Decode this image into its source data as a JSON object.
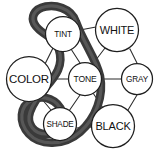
{
  "diagram": {
    "type": "node-link-graph",
    "canvas": {
      "width": 159,
      "height": 156,
      "background": "#ffffff"
    },
    "style": {
      "node_fill": "#ffffff",
      "node_stroke": "#1f1f1f",
      "edge_stroke": "#2b2b2b",
      "ribbon_outer": "#3a3a3a",
      "ribbon_inner": "#6f6f6f",
      "label_color": "#111111"
    },
    "nodes": [
      {
        "id": "tint",
        "label": "TINT",
        "cx": 63,
        "cy": 34,
        "r": 17.5,
        "font_size": 8.2
      },
      {
        "id": "white",
        "label": "WHITE",
        "cx": 117,
        "cy": 30,
        "r": 21.5,
        "font_size": 11.0
      },
      {
        "id": "color",
        "label": "COLOR",
        "cx": 29,
        "cy": 79,
        "r": 22.5,
        "font_size": 11.5
      },
      {
        "id": "tone",
        "label": "TONE",
        "cx": 85,
        "cy": 79,
        "r": 16.5,
        "font_size": 8.6
      },
      {
        "id": "gray",
        "label": "GRAY",
        "cx": 137,
        "cy": 79,
        "r": 15.5,
        "font_size": 8.2
      },
      {
        "id": "shade",
        "label": "SHADE",
        "cx": 60,
        "cy": 124,
        "r": 16.5,
        "font_size": 8.2
      },
      {
        "id": "black",
        "label": "BLACK",
        "cx": 113,
        "cy": 126,
        "r": 21.5,
        "font_size": 11.0
      }
    ],
    "edges": [
      {
        "id": "color-tint",
        "from": "color",
        "to": "tint",
        "label": ""
      },
      {
        "id": "tint-tone",
        "from": "tint",
        "to": "tone",
        "label": ""
      },
      {
        "id": "tint-white",
        "from": "tint",
        "to": "white",
        "label": ""
      },
      {
        "id": "white-tone",
        "from": "white",
        "to": "tone",
        "label": ""
      },
      {
        "id": "white-gray",
        "from": "white",
        "to": "gray",
        "label": ""
      },
      {
        "id": "color-tone",
        "from": "color",
        "to": "tone",
        "label": ""
      },
      {
        "id": "tone-gray",
        "from": "tone",
        "to": "gray",
        "label": ""
      },
      {
        "id": "color-shade",
        "from": "color",
        "to": "shade",
        "label": ""
      },
      {
        "id": "shade-tone",
        "from": "shade",
        "to": "tone",
        "label": ""
      },
      {
        "id": "tone-black",
        "from": "tone",
        "to": "black",
        "label": ""
      },
      {
        "id": "shade-black",
        "from": "shade",
        "to": "black",
        "label": ""
      },
      {
        "id": "black-gray",
        "from": "black",
        "to": "gray",
        "label": ""
      }
    ],
    "ribbon": {
      "id": "s-curve-highlight",
      "description": "thick dark S-shaped closed ribbon looping around TINT and SHADE",
      "path_outer": "M 76 22 C 84 44, 96 58, 100 76 C 104 96, 96 118, 80 132 C 64 146, 40 146, 29 134 C 18 122, 20 106, 32 100 C 44 94, 58 100, 62 112 C 66 124, 58 134, 46 134 C 34 134, 26 124, 30 112 C 36 94, 52 84, 58 70 C 64 56, 58 42, 48 36 C 38 30, 30 22, 34 14 C 38 6, 52 4, 62 8 C 70 11, 74 16, 76 22 Z",
      "path_inner": ""
    }
  }
}
